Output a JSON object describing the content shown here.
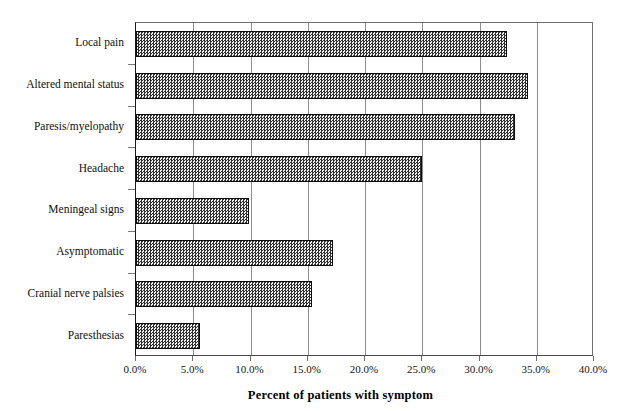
{
  "chart_data": {
    "type": "bar",
    "orientation": "horizontal",
    "title": "",
    "subtitle": "",
    "xlabel": "Percent of patients with symptom",
    "ylabel": "",
    "xlim": [
      0,
      40
    ],
    "xtick_labels": [
      "0.0%",
      "5.0%",
      "10.0%",
      "15.0%",
      "20.0%",
      "25.0%",
      "30.0%",
      "35.0%",
      "40.0%"
    ],
    "xtick_values": [
      0,
      5,
      10,
      15,
      20,
      25,
      30,
      35,
      40
    ],
    "grid": "vertical",
    "legend": "none",
    "categories": [
      "Local pain",
      "Altered mental status",
      "Paresis/myelopathy",
      "Headache",
      "Meningeal signs",
      "Asymptomatic",
      "Cranial nerve palsies",
      "Paresthesias"
    ],
    "values": [
      32.4,
      34.2,
      33.1,
      25.0,
      9.9,
      17.2,
      15.4,
      5.6
    ],
    "value_unit": "%",
    "bar_fill": "checkered-gray-hatch",
    "bar_border_color": "#0d0d0d",
    "gridline_color": "#8d8d8d",
    "axis_color": "#1a1a1a",
    "background_color": "#ffffff"
  }
}
